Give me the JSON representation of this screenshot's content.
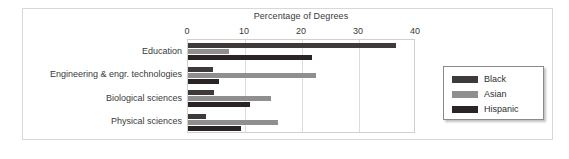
{
  "chart_data": {
    "type": "bar",
    "orientation": "horizontal",
    "title": "Percentage of Degrees",
    "xlabel": "",
    "ylabel": "",
    "xlim": [
      0,
      40
    ],
    "xticks": [
      0,
      10,
      20,
      30,
      40
    ],
    "xtick_labels": [
      "0",
      "10",
      "20",
      "30",
      "40"
    ],
    "grid": true,
    "legend_position": "right",
    "categories": [
      "Education",
      "Engineering & engr. technologies",
      "Biological sciences",
      "Physical sciences"
    ],
    "series": [
      {
        "name": "Black",
        "color": "#3f3a3a",
        "values": [
          36.5,
          4.3,
          4.6,
          3.2
        ]
      },
      {
        "name": "Asian",
        "color": "#8f8f8f",
        "values": [
          7.2,
          22.5,
          14.5,
          15.8
        ]
      },
      {
        "name": "Hispanic",
        "color": "#2b2424",
        "values": [
          21.8,
          5.5,
          10.8,
          9.3
        ]
      }
    ]
  },
  "legend": {
    "items": [
      {
        "label": "Black",
        "color": "#3f3a3a"
      },
      {
        "label": "Asian",
        "color": "#8f8f8f"
      },
      {
        "label": "Hispanic",
        "color": "#2b2424"
      }
    ]
  }
}
